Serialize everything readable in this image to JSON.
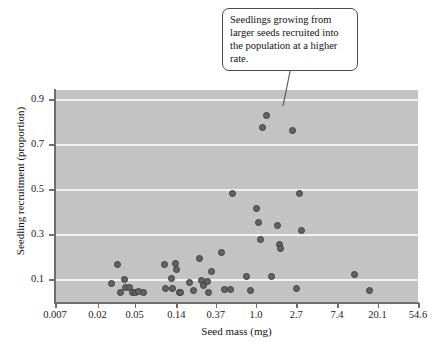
{
  "chart_data": {
    "type": "scatter",
    "title": "",
    "xlabel": "Seed mass (mg)",
    "ylabel": "Seedling recruitment (proportion)",
    "x_scale": "log",
    "x_tick_labels": [
      "0.007",
      "0.02",
      "0.05",
      "0.14",
      "0.37",
      "1.0",
      "2.7",
      "7.4",
      "20.1",
      "54.6"
    ],
    "y_tick_labels": [
      "0.9",
      "0.7",
      "0.5",
      "0.3",
      "0.1"
    ],
    "y_tick_values": [
      0.9,
      0.7,
      0.5,
      0.3,
      0.1
    ],
    "ylim": [
      0.0,
      0.94
    ],
    "grid": "horizontal",
    "legend": "none",
    "plot_background": "#c3c3c3",
    "gridline_color": "#f2f2f2",
    "point_color": "#636363",
    "point_edge_color": "#3d3d3d",
    "points": [
      {
        "x": 0.028,
        "y": 0.084
      },
      {
        "x": 0.033,
        "y": 0.166
      },
      {
        "x": 0.035,
        "y": 0.041
      },
      {
        "x": 0.039,
        "y": 0.099
      },
      {
        "x": 0.04,
        "y": 0.063
      },
      {
        "x": 0.044,
        "y": 0.066
      },
      {
        "x": 0.048,
        "y": 0.042
      },
      {
        "x": 0.051,
        "y": 0.04
      },
      {
        "x": 0.055,
        "y": 0.048
      },
      {
        "x": 0.063,
        "y": 0.041
      },
      {
        "x": 0.105,
        "y": 0.165
      },
      {
        "x": 0.108,
        "y": 0.058
      },
      {
        "x": 0.125,
        "y": 0.103
      },
      {
        "x": 0.128,
        "y": 0.06
      },
      {
        "x": 0.136,
        "y": 0.172
      },
      {
        "x": 0.139,
        "y": 0.143
      },
      {
        "x": 0.15,
        "y": 0.043
      },
      {
        "x": 0.157,
        "y": 0.042
      },
      {
        "x": 0.192,
        "y": 0.085
      },
      {
        "x": 0.212,
        "y": 0.053
      },
      {
        "x": 0.247,
        "y": 0.191
      },
      {
        "x": 0.262,
        "y": 0.094
      },
      {
        "x": 0.272,
        "y": 0.072
      },
      {
        "x": 0.3,
        "y": 0.091
      },
      {
        "x": 0.31,
        "y": 0.041
      },
      {
        "x": 0.33,
        "y": 0.136
      },
      {
        "x": 0.43,
        "y": 0.221
      },
      {
        "x": 0.46,
        "y": 0.055
      },
      {
        "x": 0.53,
        "y": 0.056
      },
      {
        "x": 0.56,
        "y": 0.48
      },
      {
        "x": 0.79,
        "y": 0.114
      },
      {
        "x": 0.88,
        "y": 0.049
      },
      {
        "x": 1.02,
        "y": 0.416
      },
      {
        "x": 1.06,
        "y": 0.354
      },
      {
        "x": 1.12,
        "y": 0.275
      },
      {
        "x": 1.18,
        "y": 0.775
      },
      {
        "x": 1.29,
        "y": 0.825
      },
      {
        "x": 1.45,
        "y": 0.114
      },
      {
        "x": 1.7,
        "y": 0.337
      },
      {
        "x": 1.79,
        "y": 0.254
      },
      {
        "x": 1.83,
        "y": 0.238
      },
      {
        "x": 2.45,
        "y": 0.762
      },
      {
        "x": 2.95,
        "y": 0.481
      },
      {
        "x": 2.7,
        "y": 0.06
      },
      {
        "x": 3.05,
        "y": 0.315
      },
      {
        "x": 11.5,
        "y": 0.121
      },
      {
        "x": 16.3,
        "y": 0.053
      }
    ]
  },
  "annotations": {
    "callout": {
      "text": "Seedlings growing from larger seeds recruited into the population at a higher rate."
    }
  }
}
